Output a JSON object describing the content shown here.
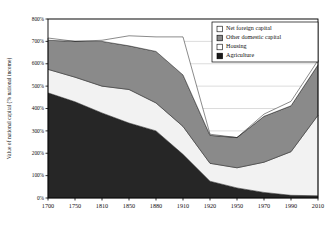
{
  "chart_data": {
    "type": "area",
    "stacked": true,
    "title": "",
    "xlabel": "",
    "ylabel": "Value of national capital (% national income)",
    "ylim": [
      0,
      800
    ],
    "ytick_step": 100,
    "ytick_labels": [
      "0%",
      "100%",
      "200%",
      "300%",
      "400%",
      "500%",
      "600%",
      "700%",
      "800%"
    ],
    "ytick_values": [
      0,
      100,
      200,
      300,
      400,
      500,
      600,
      700,
      800
    ],
    "grid": true,
    "grid_axis": "y",
    "categories": [
      1700,
      1750,
      1810,
      1850,
      1880,
      1910,
      1920,
      1950,
      1970,
      1990,
      2010
    ],
    "xtick_labels": [
      "1700",
      "1750",
      "1810",
      "1850",
      "1880",
      "1910",
      "1920",
      "1950",
      "1970",
      "1990",
      "2010"
    ],
    "legend_position": "top-right",
    "series": [
      {
        "name": "Agriculture",
        "color": "#262626",
        "values": [
          470,
          430,
          380,
          335,
          300,
          195,
          75,
          45,
          25,
          12,
          10
        ]
      },
      {
        "name": "Housing",
        "color": "#f2f2f2",
        "values": [
          105,
          110,
          120,
          150,
          125,
          125,
          80,
          90,
          135,
          195,
          360
        ]
      },
      {
        "name": "Other domestic capital",
        "color": "#8a8a8a",
        "values": [
          130,
          160,
          200,
          195,
          230,
          230,
          125,
          135,
          205,
          205,
          225
        ]
      },
      {
        "name": "Net foreign capital",
        "color": "#ffffff",
        "values": [
          10,
          0,
          5,
          45,
          65,
          170,
          5,
          0,
          10,
          20,
          20
        ]
      }
    ],
    "stack_tops": {
      "agriculture": [
        470,
        430,
        380,
        335,
        300,
        195,
        75,
        45,
        25,
        12,
        10
      ],
      "housing": [
        575,
        540,
        500,
        485,
        425,
        320,
        155,
        135,
        160,
        207,
        370
      ],
      "other_domestic": [
        705,
        700,
        700,
        680,
        655,
        550,
        280,
        270,
        365,
        412,
        595
      ],
      "total": [
        715,
        700,
        705,
        725,
        720,
        720,
        285,
        270,
        375,
        432,
        615
      ]
    }
  },
  "legend": {
    "items": [
      {
        "label": "Net foreign capital",
        "swatch": "#ffffff"
      },
      {
        "label": "Other domestic capital",
        "swatch": "#8a8a8a"
      },
      {
        "label": "Housing",
        "swatch": "#ffffff"
      },
      {
        "label": "Agriculture",
        "swatch": "#1a1a1a"
      }
    ]
  }
}
